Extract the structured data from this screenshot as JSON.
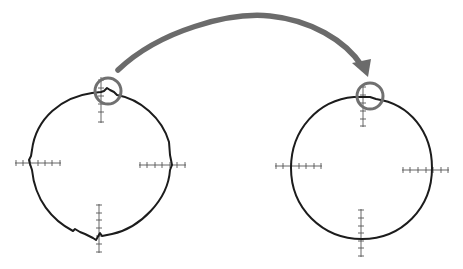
{
  "diagram": {
    "type": "before-after-comparison",
    "colors": {
      "outline": "#1c1c1c",
      "ruler": "#555555",
      "highlight": "#707070",
      "arrow": "#6b6b6b",
      "background": "#ffffff"
    },
    "shapes": [
      {
        "id": "before",
        "label": "irregular circle outline",
        "center": [
          101,
          163
        ],
        "radius": 70,
        "style": "jagged",
        "highlight": {
          "center": [
            108,
            91
          ],
          "radius": 13
        },
        "rulers": [
          {
            "position": "top",
            "orientation": "vertical",
            "ticks": 6
          },
          {
            "position": "left",
            "orientation": "horizontal",
            "ticks": 7
          },
          {
            "position": "right",
            "orientation": "horizontal",
            "ticks": 7
          },
          {
            "position": "bottom",
            "orientation": "vertical",
            "ticks": 7
          }
        ]
      },
      {
        "id": "after",
        "label": "smoothed circle outline",
        "center": [
          362,
          170
        ],
        "radius": 70,
        "style": "smooth",
        "highlight": {
          "center": [
            370,
            96
          ],
          "radius": 13
        },
        "rulers": [
          {
            "position": "top",
            "orientation": "vertical",
            "ticks": 6
          },
          {
            "position": "left",
            "orientation": "horizontal",
            "ticks": 7
          },
          {
            "position": "right",
            "orientation": "horizontal",
            "ticks": 7
          },
          {
            "position": "bottom",
            "orientation": "vertical",
            "ticks": 7
          }
        ]
      }
    ],
    "arrow": {
      "from": "before",
      "to": "after",
      "direction": "left-to-right",
      "shape": "curved-arc"
    }
  }
}
